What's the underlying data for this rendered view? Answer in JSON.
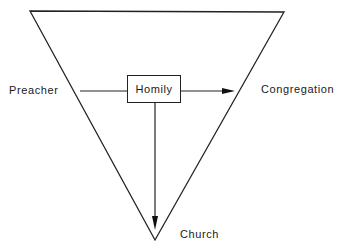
{
  "diagram": {
    "type": "inverted-triangle-flow",
    "nodes": {
      "preacher": "Preacher",
      "homily": "Homily",
      "congregation": "Congregation",
      "church": "Church"
    },
    "edges": [
      {
        "from": "preacher",
        "to": "homily",
        "arrow": false
      },
      {
        "from": "homily",
        "to": "congregation",
        "arrow": true
      },
      {
        "from": "homily",
        "to": "church",
        "arrow": true
      }
    ],
    "colors": {
      "stroke": "#222222",
      "background": "#ffffff"
    }
  }
}
